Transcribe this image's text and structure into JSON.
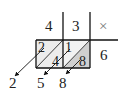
{
  "diagram": {
    "type": "lattice-multiplication",
    "header": {
      "digits": [
        "4",
        "3"
      ],
      "operator": "×"
    },
    "multiplier": "6",
    "cells": [
      {
        "tens": "2",
        "ones": "4"
      },
      {
        "tens": "1",
        "ones": "8"
      }
    ],
    "result_digits": [
      "2",
      "5",
      "8"
    ],
    "colors": {
      "line": "#111111",
      "cell_left_fill": "#ececec",
      "cell_right_fill": "#d2d2d2",
      "text": "#222222"
    }
  }
}
